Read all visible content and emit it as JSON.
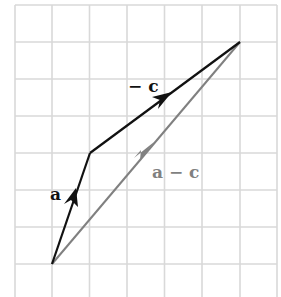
{
  "figure": {
    "type": "vector-subtraction-diagram",
    "grid": {
      "columns": 7,
      "rows": 8,
      "cell_size_px": 37.4,
      "line_color": "#d9d9d9",
      "origin_px": [
        15,
        5
      ]
    },
    "vectors": [
      {
        "id": "a",
        "label": "a",
        "from": [
          52,
          264
        ],
        "to": [
          90,
          153
        ],
        "color": "#111111"
      },
      {
        "id": "neg-c",
        "label": "− c",
        "from": [
          90,
          153
        ],
        "to": [
          240,
          42
        ],
        "color": "#111111"
      },
      {
        "id": "a-minus-c",
        "label": "a − c",
        "from": [
          52,
          264
        ],
        "to": [
          240,
          42
        ],
        "color": "#808080"
      }
    ],
    "labels": {
      "a": "a",
      "neg_c": "− c",
      "a_minus_c": "a − c"
    },
    "colors": {
      "primary": "#111111",
      "resultant": "#808080",
      "grid": "#d9d9d9"
    }
  }
}
